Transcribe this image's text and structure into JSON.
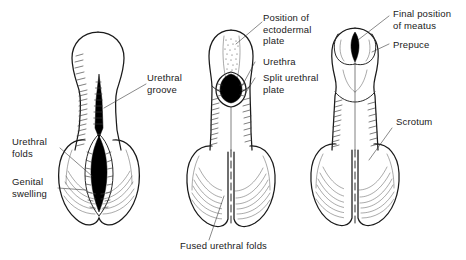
{
  "figure": {
    "type": "anatomical-diagram",
    "background_color": "#ffffff",
    "ink_color": "#1a1a1a",
    "fill_dark": "#000000",
    "panel_count": 3
  },
  "labels": {
    "urethral_groove": "Urethral\ngroove",
    "urethral_folds": "Urethral\nfolds",
    "genital_swelling": "Genital\nswelling",
    "position_of_ectodermal_plate": "Position of\nectodermal\nplate",
    "urethra": "Urethra",
    "split_urethral_plate": "Split urethral\nplate",
    "fused_urethral_folds": "Fused urethral folds",
    "final_position_of_meatus": "Final position\nof meatus",
    "prepuce": "Prepuce",
    "scrotum": "Scrotum"
  },
  "panels": [
    {
      "id": "panel-1",
      "stage": "early",
      "features": [
        "urethral groove",
        "urethral folds",
        "genital swelling"
      ]
    },
    {
      "id": "panel-2",
      "stage": "intermediate",
      "features": [
        "position of ectodermal plate",
        "urethra",
        "split urethral plate",
        "fused urethral folds"
      ]
    },
    {
      "id": "panel-3",
      "stage": "final",
      "features": [
        "final position of meatus",
        "prepuce",
        "scrotum"
      ]
    }
  ]
}
